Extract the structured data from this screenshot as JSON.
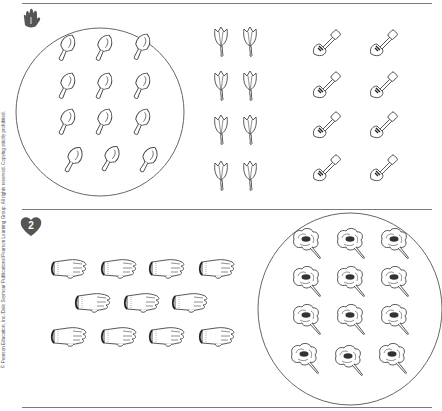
{
  "worksheet": {
    "copyright": "© Pearson Education, Inc./Dale Seymour Publications/Pearson Learning Group. All rights reserved. Copying strictly prohibited.",
    "sections": [
      {
        "marker_icon": "hand-icon",
        "groups": [
          {
            "name": "trowels",
            "count": 12,
            "circled": true,
            "rows": [
              3,
              3,
              3,
              3
            ]
          },
          {
            "name": "tulips",
            "count": 8,
            "circled": false,
            "rows": [
              2,
              2,
              2,
              2
            ]
          },
          {
            "name": "shovels",
            "count": 8,
            "circled": false,
            "rows": [
              2,
              2,
              2,
              2
            ]
          }
        ]
      },
      {
        "marker_icon": "heart-icon",
        "marker_number": "2",
        "groups": [
          {
            "name": "gloves",
            "count": 11,
            "circled": false,
            "rows": [
              4,
              3,
              4
            ]
          },
          {
            "name": "flowers",
            "count": 12,
            "circled": true,
            "rows": [
              3,
              3,
              3,
              3
            ]
          }
        ]
      }
    ]
  }
}
